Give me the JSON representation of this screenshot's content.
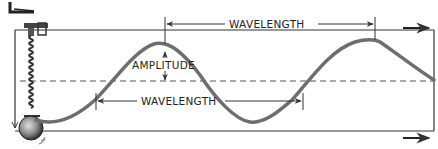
{
  "diagram": {
    "type": "transverse wave on spring-mass oscillator",
    "labels": {
      "wavelength_top": "WAVELENGTH",
      "wavelength_bottom": "WAVELENGTH",
      "amplitude": "AMPLITUDE"
    },
    "colors": {
      "wave": "#6e6e6e",
      "lines": "#333333",
      "ball": "#8a8a8a",
      "background": "#ffffff"
    },
    "elements": [
      "corner-mark",
      "frame",
      "clamp",
      "spring",
      "ball",
      "wave-curve",
      "equilibrium-dashed-line",
      "wavelength-arrow-top",
      "wavelength-arrow-bottom",
      "amplitude-arrow",
      "motion-arrow-top",
      "motion-arrow-bottom"
    ]
  }
}
